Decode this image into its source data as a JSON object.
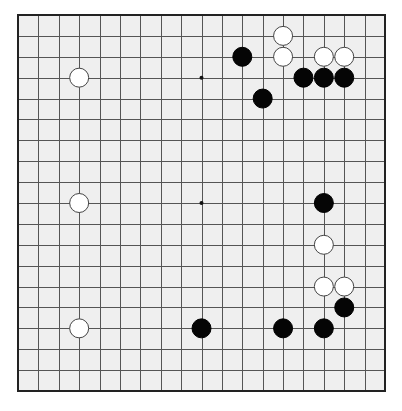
{
  "board": {
    "size": 19,
    "origin_x": 18,
    "origin_y": 15,
    "step_x": 20.39,
    "step_y": 20.89,
    "stone_radius": 9.5,
    "colors": {
      "background": "#efefef",
      "line": "#555555",
      "border": "#222222",
      "black": "#050505",
      "white": "#ffffff",
      "white_outline": "#444444"
    },
    "star_points_visible": [
      {
        "col": 9,
        "row": 3
      },
      {
        "col": 9,
        "row": 9
      }
    ],
    "stones": {
      "black": [
        {
          "col": 11,
          "row": 2
        },
        {
          "col": 14,
          "row": 3
        },
        {
          "col": 15,
          "row": 3
        },
        {
          "col": 16,
          "row": 3
        },
        {
          "col": 12,
          "row": 4
        },
        {
          "col": 15,
          "row": 9
        },
        {
          "col": 16,
          "row": 14
        },
        {
          "col": 9,
          "row": 15
        },
        {
          "col": 13,
          "row": 15
        },
        {
          "col": 15,
          "row": 15
        }
      ],
      "white": [
        {
          "col": 13,
          "row": 1
        },
        {
          "col": 13,
          "row": 2
        },
        {
          "col": 15,
          "row": 2
        },
        {
          "col": 16,
          "row": 2
        },
        {
          "col": 3,
          "row": 3
        },
        {
          "col": 3,
          "row": 9
        },
        {
          "col": 15,
          "row": 11
        },
        {
          "col": 15,
          "row": 13
        },
        {
          "col": 16,
          "row": 13
        },
        {
          "col": 3,
          "row": 15
        }
      ]
    }
  }
}
